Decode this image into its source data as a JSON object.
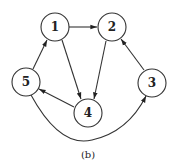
{
  "diagram": {
    "type": "directed-graph",
    "caption": "(b)",
    "nodes": [
      {
        "id": "1",
        "label": "1",
        "x": 55,
        "y": 27
      },
      {
        "id": "2",
        "label": "2",
        "x": 112,
        "y": 27
      },
      {
        "id": "3",
        "label": "3",
        "x": 152,
        "y": 83
      },
      {
        "id": "4",
        "label": "4",
        "x": 88,
        "y": 113
      },
      {
        "id": "5",
        "label": "5",
        "x": 26,
        "y": 82
      }
    ],
    "edges": [
      {
        "from": "1",
        "to": "2"
      },
      {
        "from": "1",
        "to": "4"
      },
      {
        "from": "2",
        "to": "4"
      },
      {
        "from": "3",
        "to": "2"
      },
      {
        "from": "4",
        "to": "5"
      },
      {
        "from": "5",
        "to": "1"
      },
      {
        "from": "5",
        "to": "3",
        "curved": true
      }
    ]
  }
}
